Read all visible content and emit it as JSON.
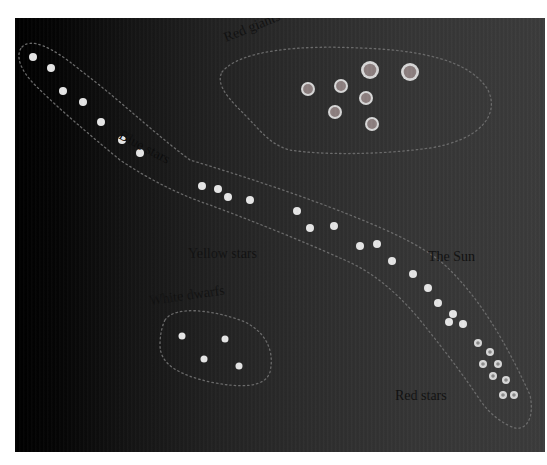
{
  "diagram": {
    "background": {
      "left": "#000000",
      "right": "#3b3b3b"
    },
    "labels": {
      "blue_stars": "Blue stars",
      "red_giants": "Red giants",
      "yellow_stars": "Yellow stars",
      "the_sun": "The Sun",
      "white_dwarfs": "White dwarfs",
      "red_stars": "Red stars"
    },
    "groups": {
      "main_sequence_upper": [
        [
          33,
          57
        ],
        [
          51,
          68
        ],
        [
          63,
          91
        ],
        [
          83,
          102
        ],
        [
          101,
          122
        ],
        [
          122,
          140
        ],
        [
          140,
          153
        ]
      ],
      "main_sequence_middle": [
        [
          202,
          186
        ],
        [
          218,
          189
        ],
        [
          228,
          197
        ],
        [
          250,
          200
        ],
        [
          297,
          211
        ],
        [
          310,
          228
        ],
        [
          334,
          226
        ],
        [
          360,
          246
        ],
        [
          377,
          244
        ]
      ],
      "main_sequence_lower": [
        [
          392,
          261
        ],
        [
          413,
          274
        ],
        [
          428,
          288
        ],
        [
          438,
          303
        ],
        [
          453,
          314
        ],
        [
          449,
          322
        ],
        [
          463,
          324
        ]
      ],
      "red_stars": [
        [
          478,
          343
        ],
        [
          490,
          352
        ],
        [
          483,
          364
        ],
        [
          498,
          364
        ],
        [
          493,
          376
        ],
        [
          506,
          380
        ],
        [
          503,
          395
        ],
        [
          514,
          395
        ]
      ],
      "red_giants": [
        [
          308,
          89,
          7
        ],
        [
          341,
          86,
          7
        ],
        [
          370,
          70,
          9
        ],
        [
          410,
          72,
          9
        ],
        [
          366,
          98,
          7
        ],
        [
          335,
          112,
          7
        ],
        [
          372,
          124,
          7
        ]
      ],
      "white_dwarfs": [
        [
          182,
          336
        ],
        [
          225,
          339
        ],
        [
          204,
          359
        ],
        [
          239,
          366
        ]
      ]
    }
  }
}
